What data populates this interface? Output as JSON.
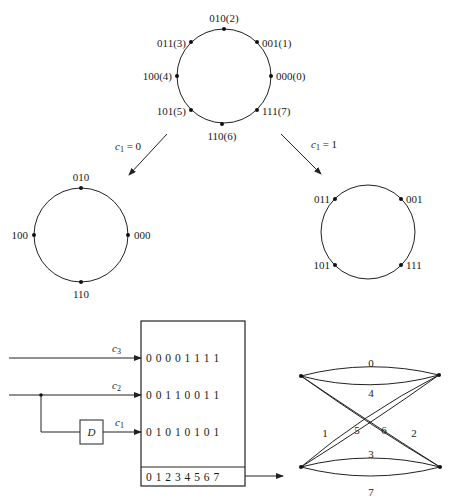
{
  "figure": {
    "type": "8-PSK set partitioning and trellis-coded mapping diagram",
    "top_ring": {
      "points": [
        {
          "label": "000(0)",
          "bits": "000",
          "index": 0
        },
        {
          "label": "001(1)",
          "bits": "001",
          "index": 1
        },
        {
          "label": "010(2)",
          "bits": "010",
          "index": 2
        },
        {
          "label": "011(3)",
          "bits": "011",
          "index": 3
        },
        {
          "label": "100(4)",
          "bits": "100",
          "index": 4
        },
        {
          "label": "101(5)",
          "bits": "101",
          "index": 5
        },
        {
          "label": "110(6)",
          "bits": "110",
          "index": 6
        },
        {
          "label": "111(7)",
          "bits": "111",
          "index": 7
        }
      ]
    },
    "branches": {
      "left": {
        "label_var": "c",
        "label_sub": "1",
        "label_eq": " = 0"
      },
      "right": {
        "label_var": "c",
        "label_sub": "1",
        "label_eq": " = 1"
      }
    },
    "left_ring": {
      "points": [
        "010",
        "000",
        "110",
        "100"
      ]
    },
    "right_ring": {
      "points": [
        "011",
        "001",
        "111",
        "101"
      ]
    },
    "encoder": {
      "inputs": [
        {
          "var": "c",
          "sub": "3",
          "bits": "0 0 0 0 1 1 1 1"
        },
        {
          "var": "c",
          "sub": "2",
          "bits": "0 0 1 1 0 0 1 1"
        },
        {
          "var": "c",
          "sub": "1",
          "bits": "0 1 0 1 0 1 0 1"
        }
      ],
      "delay_label": "D",
      "output_row": "0 1 2 3 4 5 6 7"
    },
    "trellis": {
      "branch_labels": [
        "0",
        "4",
        "1",
        "5",
        "6",
        "2",
        "3",
        "7"
      ]
    },
    "caption": "Figure: 8-PSK signal set partitioning and trellis mapping (caption cropped)"
  }
}
